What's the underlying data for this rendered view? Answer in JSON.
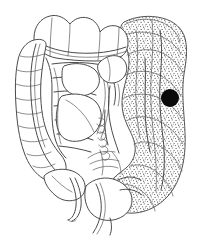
{
  "figure": {
    "title": "Large intestine (colon) anatomical diagram",
    "caption": "",
    "background_color": "#ffffff",
    "line_color": "#4a4a4a",
    "shading_color": "#6b6b6b",
    "marker_color": "#0a0a0a",
    "width": 199,
    "height": 241
  },
  "regions": [
    {
      "id": "transverse-colon",
      "label": "Transverse colon",
      "shaded": "false"
    },
    {
      "id": "ascending-colon",
      "label": "Ascending colon",
      "shaded": "false"
    },
    {
      "id": "cecum",
      "label": "Cecum",
      "shaded": "false"
    },
    {
      "id": "appendix",
      "label": "Appendix",
      "shaded": "false"
    },
    {
      "id": "descending-colon",
      "label": "Descending colon",
      "shaded": "true"
    },
    {
      "id": "sigmoid-colon",
      "label": "Sigmoid colon",
      "shaded": "true"
    },
    {
      "id": "rectum",
      "label": "Rectum",
      "shaded": "false"
    },
    {
      "id": "mesentery",
      "label": "Mesentery and vessels",
      "shaded": "false"
    }
  ],
  "marker": {
    "name": "lesion-marker",
    "shape": "filled-circle",
    "color": "#0a0a0a",
    "x": 170,
    "y": 98,
    "radius": 9
  },
  "legend": {
    "shaded_meaning": "Shaded (stippled) region",
    "marker_meaning": "Marked site"
  }
}
